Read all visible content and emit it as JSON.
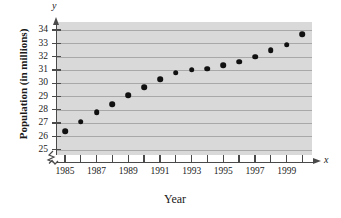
{
  "chart_data": {
    "type": "scatter",
    "title": "",
    "xlabel": "Year",
    "ylabel": "Population (in millions)",
    "x_axis_symbol": "x",
    "y_axis_symbol": "y",
    "xlim": [
      1984.5,
      2000.6
    ],
    "ylim": [
      24.6,
      34.6
    ],
    "grid": true,
    "axis_break": true,
    "legend": "none",
    "x_tick_values": [
      1985,
      1986,
      1987,
      1988,
      1989,
      1990,
      1991,
      1992,
      1993,
      1994,
      1995,
      1996,
      1997,
      1998,
      1999,
      2000
    ],
    "x_tick_labels": [
      "1985",
      "",
      "1987",
      "",
      "1989",
      "",
      "1991",
      "",
      "1993",
      "",
      "1995",
      "",
      "1997",
      "",
      "1999",
      ""
    ],
    "y_tick_values": [
      25,
      26,
      27,
      28,
      29,
      30,
      31,
      32,
      33,
      34
    ],
    "y_tick_labels": [
      "25",
      "26",
      "27",
      "28",
      "29",
      "30",
      "31",
      "32",
      "33",
      "34"
    ],
    "x": [
      1985,
      1986,
      1987,
      1988,
      1989,
      1990,
      1991,
      1992,
      1993,
      1994,
      1995,
      1996,
      1997,
      1998,
      1999,
      2000
    ],
    "values": [
      26.4,
      27.1,
      27.8,
      28.4,
      29.1,
      29.7,
      30.3,
      30.8,
      31.0,
      31.1,
      31.35,
      31.6,
      32.0,
      32.5,
      32.9,
      33.7
    ],
    "point_color": "#111111",
    "plot_background": "#d9d9d9",
    "gridline_color": "#a8a8a8",
    "axis_color": "#4a4a4a"
  }
}
